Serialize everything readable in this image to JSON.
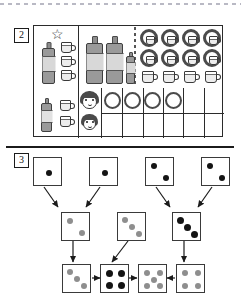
{
  "page": {
    "top_rule": "dotted-separator",
    "mid_rule": "solid-separator"
  },
  "exercises": [
    {
      "number": "2",
      "type": "drink-and-cup-table",
      "header_icon": "star-icon",
      "legend_column": {
        "star": "☆",
        "bottle_count": 1,
        "cup_count": 3
      },
      "top_row": {
        "large_bottles": 2,
        "small_bottles": 1,
        "ringed_cups_row1": 4,
        "ringed_cups_row2": 4,
        "plain_cups_row3": 4
      },
      "bottom_row": {
        "bottle_count": 1,
        "cup_count": 2,
        "faces": [
          "boy-face",
          "girl-face"
        ],
        "grid_columns": 6,
        "grid_rows": 2,
        "filled_circles": 4
      }
    },
    {
      "number": "3",
      "type": "dice-flow-diagram",
      "rows": [
        {
          "row": "top",
          "dice": [
            {
              "pips": 1,
              "color": "black",
              "pattern": "center"
            },
            {
              "pips": 1,
              "color": "black",
              "pattern": "center"
            },
            {
              "pips": 2,
              "color": "black",
              "pattern": "diagonal"
            },
            {
              "pips": 2,
              "color": "black",
              "pattern": "diagonal"
            }
          ]
        },
        {
          "row": "middle",
          "dice": [
            {
              "pips": 2,
              "color": "gray",
              "pattern": "diagonal"
            },
            {
              "pips": 3,
              "color": "gray",
              "pattern": "diagonal"
            },
            {
              "pips": 3,
              "color": "black",
              "pattern": "diagonal"
            }
          ]
        },
        {
          "row": "bottom",
          "dice": [
            {
              "pips": 3,
              "color": "gray",
              "pattern": "diagonal"
            },
            {
              "pips": 4,
              "color": "black",
              "pattern": "corners"
            },
            {
              "pips": 5,
              "color": "gray",
              "pattern": "quincunx"
            },
            {
              "pips": 4,
              "color": "gray",
              "pattern": "corners"
            }
          ]
        }
      ],
      "arrows": [
        {
          "from": "top-1",
          "to": "middle-1",
          "direction": "down-right"
        },
        {
          "from": "top-2",
          "to": "middle-1",
          "direction": "down-left"
        },
        {
          "from": "top-3",
          "to": "middle-3",
          "direction": "down-right"
        },
        {
          "from": "top-4",
          "to": "middle-3",
          "direction": "down-left"
        },
        {
          "from": "middle-1",
          "to": "bottom-1",
          "direction": "down"
        },
        {
          "from": "middle-2",
          "to": "bottom-2",
          "direction": "down-left"
        },
        {
          "from": "middle-3",
          "to": "bottom-4",
          "direction": "down"
        },
        {
          "from": "bottom-1",
          "to": "bottom-2",
          "direction": "right"
        },
        {
          "from": "bottom-2",
          "to": "bottom-3",
          "direction": "right"
        },
        {
          "from": "bottom-4",
          "to": "bottom-3",
          "direction": "left"
        }
      ]
    }
  ],
  "colors": {
    "ink": "#1b1b1b",
    "line": "#3a3a3a",
    "pip_black": "#141414",
    "pip_gray": "#8e8e8e",
    "ring": "#4b4b4b",
    "dotted": "#b9b9c4"
  }
}
